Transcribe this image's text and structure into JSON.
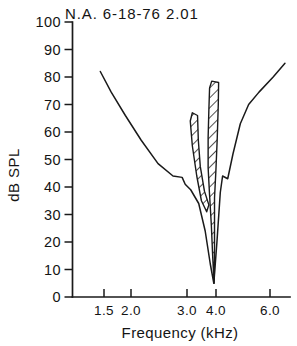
{
  "figure": {
    "title": "N.A. 6-18-76  2.01",
    "background": "#ffffff",
    "ink_color": "#1a1a1a"
  },
  "axes": {
    "y_title": "dB SPL",
    "x_title": "Frequency (kHz)",
    "y_ticks": [
      "100",
      "90",
      "80",
      "70",
      "60",
      "50",
      "40",
      "30",
      "20",
      "10",
      "0"
    ],
    "x_ticks": [
      "1.5",
      "2.0",
      "3.0",
      "4.0",
      "6.0"
    ]
  },
  "chart_data": {
    "type": "line",
    "title": "N.A. 6-18-76  2.01",
    "xlabel": "Frequency (kHz)",
    "ylabel": "dB SPL",
    "xscale": "log",
    "xlim": [
      1.35,
      6.8
    ],
    "ylim": [
      0,
      100
    ],
    "grid": false,
    "legend": "none",
    "x_tick_values": [
      1.5,
      2.0,
      3.0,
      4.0,
      6.0
    ],
    "y_tick_values": [
      0,
      10,
      20,
      30,
      40,
      50,
      60,
      70,
      80,
      90,
      100
    ],
    "series": [
      {
        "name": "Tuning curve (threshold)",
        "type": "line",
        "fill": "none",
        "points": [
          [
            1.66,
            82.0
          ],
          [
            1.8,
            74.5
          ],
          [
            2.0,
            66.0
          ],
          [
            2.25,
            57.0
          ],
          [
            2.55,
            48.5
          ],
          [
            2.85,
            44.0
          ],
          [
            3.05,
            43.5
          ],
          [
            3.12,
            41.0
          ],
          [
            3.25,
            39.0
          ],
          [
            3.45,
            34.0
          ],
          [
            3.62,
            24.0
          ],
          [
            3.76,
            12.0
          ],
          [
            3.86,
            5.0
          ],
          [
            3.95,
            20.0
          ],
          [
            4.05,
            38.0
          ],
          [
            4.12,
            44.0
          ],
          [
            4.28,
            43.0
          ],
          [
            4.45,
            52.0
          ],
          [
            4.7,
            63.0
          ],
          [
            5.0,
            70.0
          ],
          [
            5.4,
            74.5
          ],
          [
            6.0,
            80.0
          ],
          [
            6.55,
            85.0
          ]
        ]
      },
      {
        "name": "Two-tone suppression area (hatched)",
        "type": "hatched-region",
        "hatch": "diagonal-45",
        "regions": [
          {
            "name": "left-finger",
            "comment": "narrow hatched band rising to the left of best frequency",
            "outline": [
              [
                3.29,
                67.0
              ],
              [
                3.42,
                66.0
              ],
              [
                3.44,
                57.0
              ],
              [
                3.49,
                47.5
              ],
              [
                3.6,
                38.5
              ],
              [
                3.72,
                33.5
              ],
              [
                3.66,
                31.0
              ],
              [
                3.52,
                35.0
              ],
              [
                3.4,
                44.0
              ],
              [
                3.29,
                55.0
              ],
              [
                3.24,
                64.0
              ]
            ]
          },
          {
            "name": "right-finger-and-spike",
            "comment": "tall hatched band at best frequency tapering to a point near 5 dB",
            "outline": [
              [
                3.8,
                78.5
              ],
              [
                4.0,
                78.0
              ],
              [
                3.99,
                70.0
              ],
              [
                3.96,
                58.0
              ],
              [
                3.92,
                46.0
              ],
              [
                3.88,
                36.0
              ],
              [
                3.88,
                25.0
              ],
              [
                3.88,
                13.0
              ],
              [
                3.87,
                5.0
              ],
              [
                3.83,
                14.0
              ],
              [
                3.79,
                26.0
              ],
              [
                3.74,
                37.0
              ],
              [
                3.7,
                47.0
              ],
              [
                3.7,
                58.0
              ],
              [
                3.72,
                68.0
              ],
              [
                3.74,
                76.0
              ]
            ]
          }
        ]
      }
    ],
    "annotations": [
      {
        "text": "best frequency tip",
        "x": 3.86,
        "y": 5.0
      }
    ]
  }
}
